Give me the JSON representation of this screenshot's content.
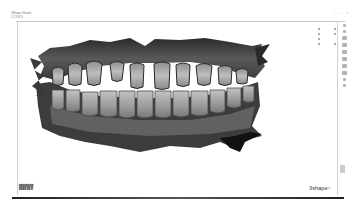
{
  "window": {
    "title": "3Shape Viewer",
    "subtitle": "1  2  3  4 5",
    "controls": [
      "minimize",
      "maximize",
      "close"
    ]
  },
  "viewport": {
    "content": "3D intraoral dental scan, upper and lower arches, frontal view, grayscale render",
    "background": "#ffffff"
  },
  "right_toolbar": {
    "icons": [
      "view-front-icon",
      "view-back-icon",
      "view-left-icon",
      "view-right-icon",
      "view-top-icon",
      "view-bottom-icon",
      "rotate-icon",
      "zoom-icon",
      "pan-icon",
      "measure-icon",
      "layers-icon"
    ]
  },
  "bottom_info": {
    "line1": "████████",
    "line2": "████ ██ █"
  },
  "logo": {
    "text": "3shape",
    "mark": "▷"
  },
  "colors": {
    "scan_dark": "#1a1a1a",
    "scan_mid": "#6e6e6e",
    "scan_light": "#b9b9b9",
    "tooth": "#a9a9a9",
    "rule": "#cccccc"
  }
}
